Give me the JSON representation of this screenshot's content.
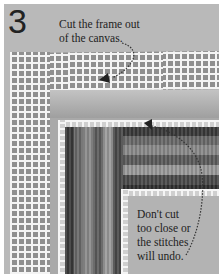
{
  "step": {
    "number": "3",
    "captions": {
      "top_line1": "Cut the frame out",
      "top_line2": "of the canvas.",
      "bottom_line1": "Don't cut",
      "bottom_line2": "too close or",
      "bottom_line3": "the stitches",
      "bottom_line4": "will undo."
    }
  },
  "colors": {
    "background": "#b9b9b9",
    "mesh": "#f4f4f4",
    "text": "#222222"
  }
}
